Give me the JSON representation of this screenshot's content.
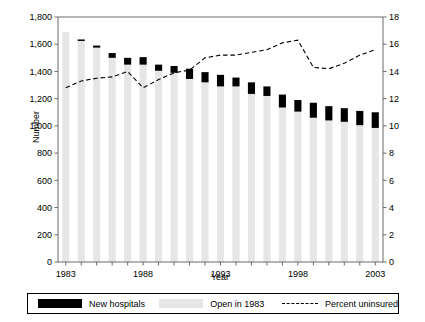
{
  "chart_data": {
    "type": "bar",
    "title": "",
    "xlabel": "Year",
    "ylabel": "Number",
    "ylabel_right": "",
    "x": [
      1983,
      1984,
      1985,
      1986,
      1987,
      1988,
      1989,
      1990,
      1991,
      1992,
      1993,
      1994,
      1995,
      1996,
      1997,
      1998,
      1999,
      2000,
      2001,
      2002,
      2003
    ],
    "categories": [
      "1983",
      "1984",
      "1985",
      "1986",
      "1987",
      "1988",
      "1989",
      "1990",
      "1991",
      "1992",
      "1993",
      "1994",
      "1995",
      "1996",
      "1997",
      "1998",
      "1999",
      "2000",
      "2001",
      "2002",
      "2003"
    ],
    "xticklabels": [
      "1983",
      "1988",
      "1993",
      "1998",
      "2003"
    ],
    "xtickvalues": [
      1983,
      1988,
      1993,
      1998,
      2003
    ],
    "ylim": [
      0,
      1800
    ],
    "yticks": [
      0,
      200,
      400,
      600,
      800,
      1000,
      1200,
      1400,
      1600,
      1800
    ],
    "yticklabels": [
      "0",
      "200",
      "400",
      "600",
      "800",
      "1,000",
      "1,200",
      "1,400",
      "1,600",
      "1,800"
    ],
    "ylim_right": [
      0,
      18
    ],
    "yticks_right": [
      0,
      2,
      4,
      6,
      8,
      10,
      12,
      14,
      16,
      18
    ],
    "yticklabels_right": [
      "0",
      "2",
      "4",
      "6",
      "8",
      "10",
      "12",
      "14",
      "16",
      "18"
    ],
    "grid": false,
    "legend_position": "bottom",
    "series": [
      {
        "name": "Open in 1983",
        "type": "bar",
        "color": "#e6e6e6",
        "axis": "left",
        "values": [
          1690,
          1625,
          1575,
          1500,
          1450,
          1450,
          1405,
          1390,
          1345,
          1320,
          1290,
          1290,
          1235,
          1220,
          1135,
          1105,
          1060,
          1040,
          1030,
          1005,
          985
        ]
      },
      {
        "name": "New hospitals",
        "type": "bar",
        "color": "#000000",
        "axis": "left",
        "values": [
          0,
          10,
          15,
          35,
          50,
          55,
          45,
          50,
          75,
          75,
          85,
          65,
          85,
          70,
          95,
          85,
          110,
          105,
          100,
          105,
          115
        ]
      },
      {
        "name": "Percent uninsured",
        "type": "line",
        "style": "dashed",
        "color": "#000000",
        "axis": "right",
        "values": [
          12.8,
          13.3,
          13.5,
          13.6,
          14.0,
          12.8,
          13.4,
          13.9,
          14.1,
          15.0,
          15.2,
          15.2,
          15.4,
          15.6,
          16.1,
          16.3,
          14.3,
          14.2,
          14.6,
          15.2,
          15.6
        ]
      }
    ]
  },
  "axes": {
    "y_left_title": "Number",
    "x_title": "Year"
  },
  "legend": {
    "items": [
      {
        "label": "New hospitals",
        "swatch": "black-bar-swatch"
      },
      {
        "label": "Open in 1983",
        "swatch": "gray-bar-swatch"
      },
      {
        "label": "Percent uninsured",
        "swatch": "dashed-line-swatch"
      }
    ]
  }
}
